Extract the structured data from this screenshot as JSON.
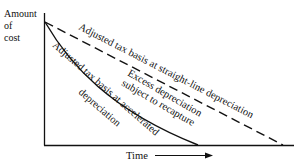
{
  "diagram": {
    "y_axis_label_lines": [
      "Amount",
      "of",
      "cost"
    ],
    "x_axis_label": "Time",
    "curves": [
      {
        "name": "accelerated",
        "style": "solid",
        "label": "Adjusted tax basis at accelerated",
        "label_line2": "depreciation"
      },
      {
        "name": "straight-line",
        "style": "dashed",
        "label": "Adjusted tax basis at straight-line depreciation"
      }
    ],
    "region_label_lines": [
      "Excess depreciation",
      "subject to recapture"
    ],
    "colors": {
      "ink": "#111111",
      "background": "#ffffff"
    }
  }
}
